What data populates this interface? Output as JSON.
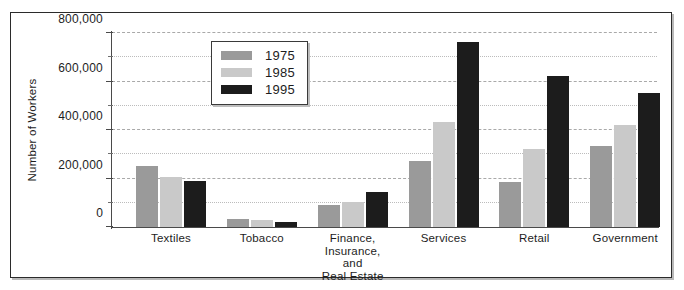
{
  "chart_data": {
    "type": "bar",
    "title": "",
    "xlabel": "",
    "ylabel": "Number of Workers",
    "ylim": [
      0,
      800000
    ],
    "ytick_labels": [
      "0",
      "200,000",
      "400,000",
      "600,000",
      "800,000"
    ],
    "ytick_values": [
      0,
      200000,
      400000,
      600000,
      800000
    ],
    "minor_tick_values": [
      100000,
      300000,
      500000,
      700000
    ],
    "grid": true,
    "grid_axis": "y",
    "legend_position": "upper center",
    "categories": [
      "Textiles",
      "Tobacco",
      "Finance,\nInsurance,\nand\nReal Estate",
      "Services",
      "Retail",
      "Government"
    ],
    "category_lines": [
      [
        "Textiles"
      ],
      [
        "Tobacco"
      ],
      [
        "Finance,",
        "Insurance,",
        "and",
        "Real Estate"
      ],
      [
        "Services"
      ],
      [
        "Retail"
      ],
      [
        "Government"
      ]
    ],
    "series": [
      {
        "name": "1975",
        "color": "#9a9a9a",
        "values": [
          253000,
          35000,
          92000,
          272000,
          185000,
          335000
        ]
      },
      {
        "name": "1985",
        "color": "#c9c9c9",
        "values": [
          208000,
          30000,
          105000,
          435000,
          323000,
          420000
        ]
      },
      {
        "name": "1995",
        "color": "#1c1c1c",
        "values": [
          190000,
          20000,
          143000,
          765000,
          622000,
          553000
        ]
      }
    ]
  },
  "legend": {
    "items": [
      {
        "label": "1975",
        "color": "#9a9a9a"
      },
      {
        "label": "1985",
        "color": "#c9c9c9"
      },
      {
        "label": "1995",
        "color": "#1c1c1c"
      }
    ]
  },
  "axis": {
    "y_title": "Number of Workers"
  },
  "colors": {
    "frame": "#2b2b2b",
    "axis": "#4a4a4a",
    "gridline": "#a9a9a9",
    "text": "#1d1d1d",
    "background": "#ffffff"
  }
}
